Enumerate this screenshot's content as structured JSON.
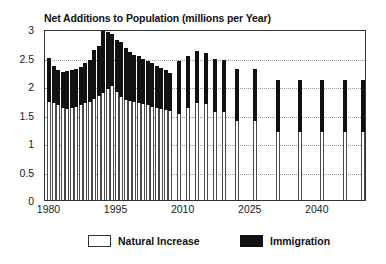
{
  "chart_data": {
    "type": "bar",
    "stacked": true,
    "title": "Net Additions to Population (millions per Year)",
    "xlabel": "",
    "ylabel": "",
    "ylim": [
      0,
      3
    ],
    "ytick_values": [
      0,
      0.5,
      1,
      1.5,
      2,
      2.5,
      3
    ],
    "ytick_labels": [
      "0",
      "0.5",
      "1",
      "1.5",
      "2",
      "2.5",
      "3"
    ],
    "xlim": [
      1979,
      2051
    ],
    "xtick_values": [
      1980,
      1995,
      2010,
      2025,
      2040
    ],
    "xtick_labels": [
      "1980",
      "1995",
      "2010",
      "2025",
      "2040"
    ],
    "grid": true,
    "grid_axis": "y",
    "legend_position": "bottom",
    "legend": [
      {
        "name": "Natural Increase",
        "color": "#ffffff"
      },
      {
        "name": "Immigration",
        "color": "#111111"
      }
    ],
    "categories": [
      1980,
      1981,
      1982,
      1983,
      1984,
      1985,
      1986,
      1987,
      1988,
      1989,
      1990,
      1991,
      1992,
      1993,
      1994,
      1995,
      1996,
      1997,
      1998,
      1999,
      2000,
      2001,
      2002,
      2003,
      2004,
      2005,
      2006,
      2007,
      2009,
      2011,
      2013,
      2015,
      2017,
      2019,
      2022,
      2026,
      2031,
      2036,
      2041,
      2046,
      2050
    ],
    "series": [
      {
        "name": "Natural Increase",
        "color": "#ffffff",
        "values": [
          1.72,
          1.7,
          1.66,
          1.62,
          1.6,
          1.62,
          1.64,
          1.66,
          1.7,
          1.72,
          1.78,
          1.82,
          1.88,
          1.94,
          2.0,
          1.9,
          1.8,
          1.76,
          1.74,
          1.72,
          1.7,
          1.68,
          1.66,
          1.64,
          1.62,
          1.6,
          1.58,
          1.57,
          1.51,
          1.61,
          1.7,
          1.69,
          1.55,
          1.55,
          1.39,
          1.39,
          1.2,
          1.2,
          1.19,
          1.19,
          1.19
        ]
      },
      {
        "name": "Immigration",
        "color": "#111111",
        "values": [
          0.77,
          0.66,
          0.62,
          0.63,
          0.67,
          0.66,
          0.66,
          0.68,
          0.7,
          0.73,
          0.86,
          0.88,
          1.11,
          1.0,
          0.92,
          0.9,
          0.98,
          0.9,
          0.86,
          0.83,
          0.82,
          0.8,
          0.78,
          0.76,
          0.74,
          0.72,
          0.7,
          0.66,
          0.93,
          0.91,
          0.91,
          0.89,
          0.92,
          0.91,
          0.91,
          0.91,
          0.91,
          0.91,
          0.91,
          0.91,
          0.91
        ]
      }
    ],
    "totals": [
      2.49,
      2.36,
      2.28,
      2.25,
      2.27,
      2.28,
      2.3,
      2.34,
      2.4,
      2.45,
      2.64,
      2.7,
      2.99,
      2.94,
      2.92,
      2.8,
      2.78,
      2.66,
      2.6,
      2.55,
      2.52,
      2.48,
      2.44,
      2.4,
      2.36,
      2.32,
      2.28,
      2.23,
      2.44,
      2.52,
      2.61,
      2.58,
      2.47,
      2.46,
      2.3,
      2.3,
      2.11,
      2.11,
      2.1,
      2.1,
      2.1
    ]
  }
}
